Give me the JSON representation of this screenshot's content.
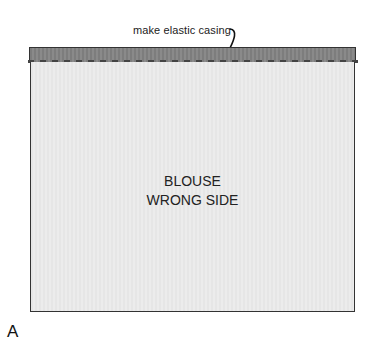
{
  "annotation": {
    "text": "make elastic casing"
  },
  "panel": {
    "line1": "BLOUSE",
    "line2": "WRONG SIDE"
  },
  "figure": {
    "label": "A"
  },
  "colors": {
    "casing": "#808080",
    "panel": "#e8e8e8",
    "outline": "#333333"
  }
}
